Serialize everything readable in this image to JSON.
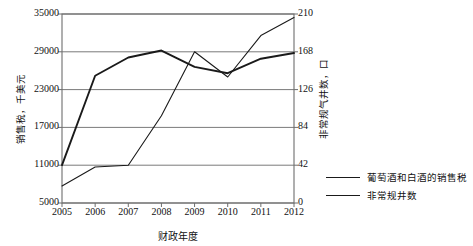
{
  "chart_data": {
    "type": "line",
    "title": "",
    "xlabel": "财政年度",
    "ylabel": "销售税，千美元",
    "y2label": "非常规气井数，口",
    "categories": [
      "2005",
      "2006",
      "2007",
      "2008",
      "2009",
      "2010",
      "2011",
      "2012"
    ],
    "x": [
      2005,
      2006,
      2007,
      2008,
      2009,
      2010,
      2011,
      2012
    ],
    "ylim": [
      5000,
      35000
    ],
    "y2lim": [
      0,
      210
    ],
    "yticks": [
      "5000",
      "11000",
      "17000",
      "23000",
      "29000",
      "35000"
    ],
    "ytick_values": [
      5000,
      11000,
      17000,
      23000,
      29000,
      35000
    ],
    "y2ticks": [
      "0",
      "42",
      "84",
      "126",
      "168",
      "210"
    ],
    "y2tick_values": [
      0,
      42,
      84,
      126,
      168,
      210
    ],
    "grid": true,
    "legend_position": "right",
    "series": [
      {
        "name": "葡萄酒和白酒的销售税",
        "axis": "left",
        "color": "#1a1a1a",
        "width": 1.9,
        "values": [
          11000,
          25200,
          28100,
          29200,
          26600,
          25600,
          27900,
          28800
        ]
      },
      {
        "name": "非常规井数",
        "axis": "right",
        "color": "#1a1a1a",
        "width": 1.1,
        "values": [
          19,
          40,
          42,
          97,
          168,
          140,
          186,
          206
        ]
      }
    ]
  },
  "legend": {
    "items": [
      {
        "label": "葡萄酒和白酒的销售税"
      },
      {
        "label": "非常规井数"
      }
    ]
  },
  "axes": {
    "x_title": "财政年度",
    "y_left_title": "销售税，千美元",
    "y_right_title": "非常规气井数，口"
  },
  "colors": {
    "line": "#1a1a1a",
    "grid": "#7a7a7a",
    "frame": "#6e6e6e",
    "background": "#ffffff"
  }
}
